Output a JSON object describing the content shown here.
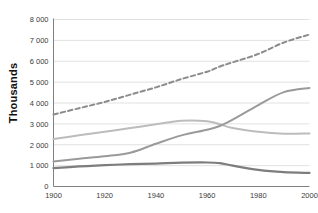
{
  "chart_data": {
    "type": "line",
    "title": "",
    "xlabel": "",
    "ylabel": "Thousands",
    "xlim": [
      1900,
      2000
    ],
    "ylim": [
      0,
      8000
    ],
    "grid": true,
    "legend": "none",
    "x_ticks": [
      "1900",
      "1920",
      "1940",
      "1960",
      "1980",
      "2000"
    ],
    "x_tick_values": [
      1900,
      1920,
      1940,
      1960,
      1980,
      2000
    ],
    "y_ticks": [
      "0",
      "1 000",
      "2 000",
      "3 000",
      "4 000",
      "5 000",
      "6 000",
      "7 000",
      "8 000"
    ],
    "y_tick_values": [
      0,
      1000,
      2000,
      3000,
      4000,
      5000,
      6000,
      7000,
      8000
    ],
    "x": [
      1900,
      1910,
      1920,
      1930,
      1940,
      1950,
      1960,
      1965,
      1970,
      1980,
      1990,
      2000
    ],
    "series": [
      {
        "name": "total-dashed",
        "color": "#8c8c8c",
        "style": "dashed",
        "width": 2.0,
        "values": [
          3450,
          3750,
          4050,
          4400,
          4750,
          5150,
          5500,
          5750,
          5950,
          6350,
          6900,
          7280
        ]
      },
      {
        "name": "upper-light-gray",
        "color": "#bcbcbc",
        "style": "solid",
        "width": 2.0,
        "values": [
          2270,
          2450,
          2620,
          2800,
          2980,
          3150,
          3130,
          2980,
          2800,
          2620,
          2530,
          2540
        ]
      },
      {
        "name": "rising-medium-gray",
        "color": "#9a9a9a",
        "style": "solid",
        "width": 2.0,
        "values": [
          1200,
          1330,
          1450,
          1620,
          2050,
          2450,
          2720,
          2900,
          3200,
          3900,
          4520,
          4720
        ]
      },
      {
        "name": "lower-dark-gray",
        "color": "#7d7d7d",
        "style": "solid",
        "width": 2.2,
        "values": [
          880,
          960,
          1020,
          1070,
          1100,
          1140,
          1150,
          1120,
          1000,
          800,
          690,
          650
        ]
      }
    ]
  },
  "axis": {
    "y_title": "Thousands"
  }
}
